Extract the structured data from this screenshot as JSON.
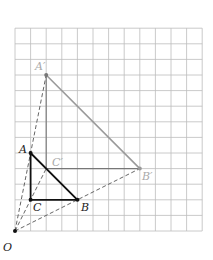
{
  "diagram": {
    "type": "dilation-on-grid",
    "grid": {
      "columns": 12,
      "rows": 13,
      "origin_px": [
        15,
        231
      ],
      "cell_px": 15.6,
      "line_color": "#bdbdbd"
    },
    "center": {
      "label": "O",
      "coords": [
        0,
        0
      ]
    },
    "original_triangle": {
      "color": "#111111",
      "vertices": [
        {
          "label": "A",
          "coords": [
            1,
            5
          ]
        },
        {
          "label": "B",
          "coords": [
            4,
            2
          ]
        },
        {
          "label": "C",
          "coords": [
            1,
            2
          ]
        }
      ]
    },
    "image_triangle": {
      "color": "#9a9a9a",
      "vertices": [
        {
          "label": "A'",
          "coords": [
            2,
            10
          ]
        },
        {
          "label": "B'",
          "coords": [
            8,
            4
          ]
        },
        {
          "label": "C'",
          "coords": [
            2,
            4
          ]
        }
      ]
    },
    "scale_factor": 2,
    "dashed_rays": [
      "O-A'",
      "O-C'",
      "O-B'"
    ]
  },
  "labels": {
    "O": "O",
    "A": "A",
    "B": "B",
    "C": "C",
    "A_prime": "A′",
    "B_prime": "B′",
    "C_prime": "C′"
  }
}
